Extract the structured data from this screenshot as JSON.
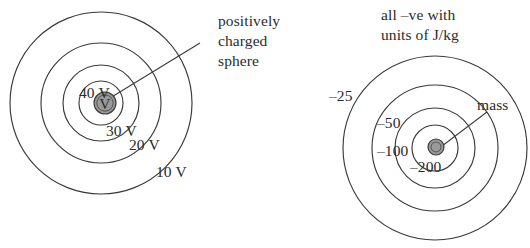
{
  "figure": {
    "background_color": "#ffffff",
    "line_color": "#3a3a3a",
    "sphere_fill_color": "#9a9a9a",
    "text_color": "#2b2b2b"
  },
  "left_diagram": {
    "name": "electric-potential-diagram",
    "annotation": {
      "line1": "positively",
      "line2": "charged",
      "line3": "sphere"
    },
    "center_label": "V",
    "rings": [
      {
        "label": "40 V",
        "value": 40,
        "unit": "V",
        "radius": 22
      },
      {
        "label": "30 V",
        "value": 30,
        "unit": "V",
        "radius": 38
      },
      {
        "label": "20 V",
        "value": 20,
        "unit": "V",
        "radius": 60
      },
      {
        "label": "10 V",
        "value": 10,
        "unit": "V",
        "radius": 91
      }
    ],
    "source_radius": 11
  },
  "right_diagram": {
    "name": "gravitational-potential-diagram",
    "caption": {
      "line1": "all –ve with",
      "line2": "units of J/kg"
    },
    "annotation": {
      "label": "mass"
    },
    "rings": [
      {
        "label": "–200",
        "value": -200,
        "unit": "J/kg",
        "radius": 23
      },
      {
        "label": "–100",
        "value": -100,
        "unit": "J/kg",
        "radius": 40
      },
      {
        "label": "–50",
        "value": -50,
        "unit": "J/kg",
        "radius": 63
      },
      {
        "label": "–25",
        "value": -25,
        "unit": "J/kg",
        "radius": 92
      }
    ],
    "source_radius": 8
  }
}
